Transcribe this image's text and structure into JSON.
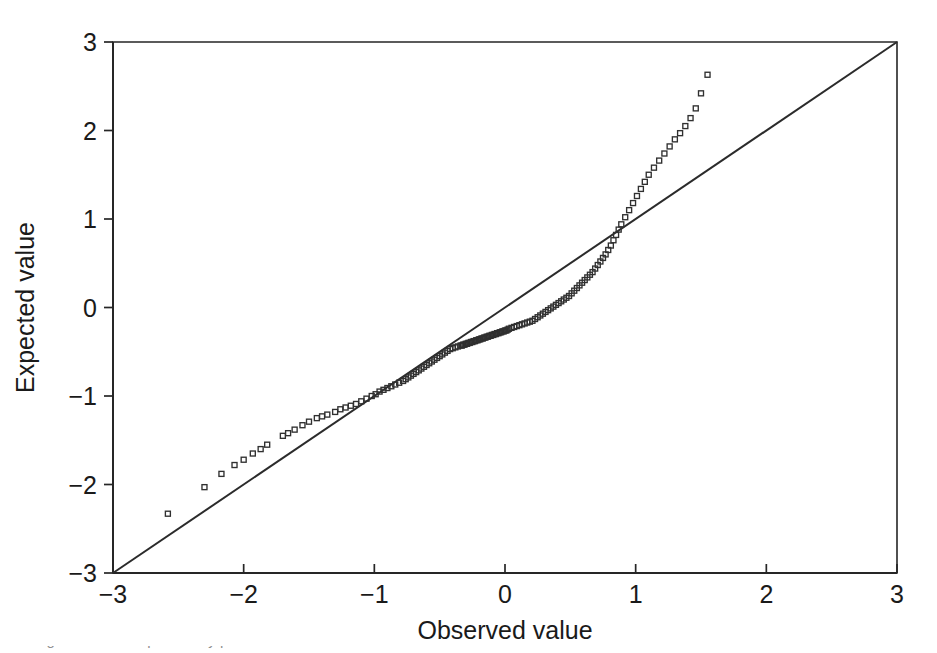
{
  "figure": {
    "kind": "qq-plot",
    "background_color": "#ffffff",
    "ink_color": "#262626",
    "caption_partial": "Figure ... normal probability plot"
  },
  "chart_data": {
    "type": "scatter",
    "title": "",
    "subtitle": "",
    "xlabel": "Observed value",
    "ylabel": "Expected value",
    "xlim": [
      -3,
      3
    ],
    "ylim": [
      -3,
      3
    ],
    "xticks": [
      -3,
      -2,
      -1,
      0,
      1,
      2,
      3
    ],
    "yticks": [
      -3,
      -2,
      -1,
      0,
      1,
      2,
      3
    ],
    "xticklabels": [
      "−3",
      "−2",
      "−1",
      "0",
      "1",
      "2",
      "3"
    ],
    "yticklabels": [
      "−3",
      "−2",
      "−1",
      "0",
      "1",
      "2",
      "3"
    ],
    "grid": false,
    "legend": false,
    "legend_position": "none",
    "marker": "open-square",
    "marker_size_px": 5,
    "annotations": [],
    "reference_line": {
      "name": "identity-line",
      "description": "45 degree line y = x drawn corner to corner",
      "x": [
        -3,
        3
      ],
      "y": [
        -3,
        3
      ],
      "slope": 1,
      "intercept": 0
    },
    "series": [
      {
        "name": "Q-Q points",
        "marker": "open-square",
        "n_points": 152,
        "x": [
          -2.58,
          -2.3,
          -2.17,
          -2.07,
          -2.0,
          -1.93,
          -1.87,
          -1.82,
          -1.7,
          -1.66,
          -1.61,
          -1.55,
          -1.5,
          -1.44,
          -1.4,
          -1.36,
          -1.3,
          -1.26,
          -1.22,
          -1.18,
          -1.14,
          -1.1,
          -1.06,
          -1.02,
          -0.99,
          -0.96,
          -0.93,
          -0.9,
          -0.87,
          -0.84,
          -0.81,
          -0.78,
          -0.76,
          -0.74,
          -0.72,
          -0.7,
          -0.68,
          -0.66,
          -0.64,
          -0.62,
          -0.6,
          -0.58,
          -0.56,
          -0.54,
          -0.52,
          -0.5,
          -0.48,
          -0.46,
          -0.44,
          -0.42,
          -0.4,
          -0.38,
          -0.36,
          -0.34,
          -0.33,
          -0.32,
          -0.31,
          -0.3,
          -0.29,
          -0.28,
          -0.27,
          -0.26,
          -0.25,
          -0.24,
          -0.23,
          -0.22,
          -0.21,
          -0.2,
          -0.19,
          -0.18,
          -0.17,
          -0.16,
          -0.15,
          -0.14,
          -0.13,
          -0.12,
          -0.11,
          -0.1,
          -0.09,
          -0.08,
          -0.07,
          -0.06,
          -0.05,
          -0.04,
          -0.03,
          -0.02,
          -0.01,
          0.0,
          0.01,
          0.02,
          0.03,
          0.05,
          0.07,
          0.09,
          0.11,
          0.13,
          0.15,
          0.17,
          0.19,
          0.21,
          0.23,
          0.25,
          0.27,
          0.29,
          0.31,
          0.33,
          0.35,
          0.37,
          0.39,
          0.41,
          0.43,
          0.45,
          0.47,
          0.49,
          0.51,
          0.53,
          0.55,
          0.57,
          0.59,
          0.61,
          0.63,
          0.65,
          0.67,
          0.69,
          0.71,
          0.73,
          0.75,
          0.77,
          0.79,
          0.81,
          0.83,
          0.85,
          0.87,
          0.89,
          0.92,
          0.95,
          0.98,
          1.01,
          1.04,
          1.07,
          1.1,
          1.14,
          1.18,
          1.22,
          1.26,
          1.3,
          1.34,
          1.38,
          1.42,
          1.46,
          1.5,
          1.55
        ],
        "y": [
          -2.33,
          -2.03,
          -1.88,
          -1.78,
          -1.72,
          -1.65,
          -1.6,
          -1.55,
          -1.45,
          -1.42,
          -1.38,
          -1.33,
          -1.29,
          -1.25,
          -1.23,
          -1.21,
          -1.18,
          -1.15,
          -1.13,
          -1.11,
          -1.09,
          -1.06,
          -1.03,
          -1.0,
          -0.98,
          -0.95,
          -0.93,
          -0.91,
          -0.89,
          -0.87,
          -0.85,
          -0.83,
          -0.81,
          -0.79,
          -0.77,
          -0.75,
          -0.73,
          -0.71,
          -0.69,
          -0.67,
          -0.65,
          -0.63,
          -0.61,
          -0.59,
          -0.57,
          -0.55,
          -0.53,
          -0.51,
          -0.49,
          -0.47,
          -0.46,
          -0.45,
          -0.44,
          -0.43,
          -0.43,
          -0.42,
          -0.42,
          -0.41,
          -0.41,
          -0.4,
          -0.4,
          -0.39,
          -0.39,
          -0.38,
          -0.38,
          -0.37,
          -0.37,
          -0.36,
          -0.36,
          -0.35,
          -0.35,
          -0.34,
          -0.34,
          -0.33,
          -0.33,
          -0.32,
          -0.32,
          -0.31,
          -0.31,
          -0.3,
          -0.3,
          -0.29,
          -0.29,
          -0.28,
          -0.28,
          -0.27,
          -0.27,
          -0.26,
          -0.26,
          -0.25,
          -0.24,
          -0.23,
          -0.22,
          -0.21,
          -0.2,
          -0.19,
          -0.18,
          -0.17,
          -0.16,
          -0.15,
          -0.13,
          -0.11,
          -0.09,
          -0.07,
          -0.05,
          -0.03,
          -0.01,
          0.01,
          0.03,
          0.05,
          0.07,
          0.09,
          0.11,
          0.13,
          0.16,
          0.19,
          0.22,
          0.25,
          0.28,
          0.31,
          0.34,
          0.37,
          0.4,
          0.44,
          0.48,
          0.52,
          0.56,
          0.6,
          0.65,
          0.7,
          0.76,
          0.82,
          0.88,
          0.94,
          1.02,
          1.1,
          1.18,
          1.26,
          1.34,
          1.42,
          1.5,
          1.58,
          1.66,
          1.74,
          1.82,
          1.9,
          1.97,
          2.05,
          2.14,
          2.25,
          2.42,
          2.63
        ]
      }
    ]
  },
  "axes": {
    "x_axis_name": "observed-value-axis",
    "y_axis_name": "expected-value-axis"
  }
}
